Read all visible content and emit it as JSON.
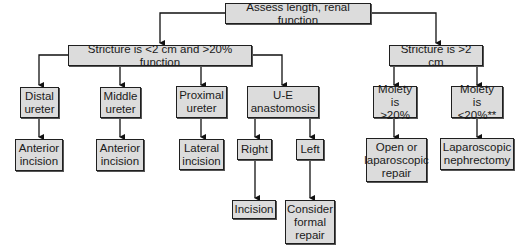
{
  "diagram": {
    "root": {
      "label": "Assess length, renal function"
    },
    "branch_short": {
      "label": "Stricture is <2 cm and >20% function"
    },
    "branch_long": {
      "label": "Stricture is >2 cm"
    },
    "distal": {
      "label": "Distal\nureter"
    },
    "middle": {
      "label": "Middle\nureter"
    },
    "proximal": {
      "label": "Proximal\nureter"
    },
    "ue": {
      "label": "U-E\nanastomosis"
    },
    "moiety_gt": {
      "label": "Moiety is\n>20%"
    },
    "moiety_lt": {
      "label": "Moiety is\n<20%**"
    },
    "distal_out": {
      "label": "Anterior\nincision"
    },
    "middle_out": {
      "label": "Anterior\nincision"
    },
    "proximal_out": {
      "label": "Lateral\nincision"
    },
    "right": {
      "label": "Right"
    },
    "left": {
      "label": "Left"
    },
    "right_out": {
      "label": "Incision"
    },
    "left_out": {
      "label": "Consider\nformal\nrepair"
    },
    "moiety_gt_out": {
      "label": "Open or\nlaparoscopic\nrepair"
    },
    "moiety_lt_out": {
      "label": "Laparoscopic\nnephrectomy"
    }
  }
}
